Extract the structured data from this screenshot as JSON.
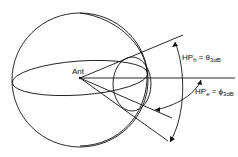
{
  "diagram": {
    "type": "antenna-beam-geometry",
    "labels": {
      "origin": "Ant",
      "hp_h_main": "HP",
      "hp_h_sub": "h",
      "hp_h_eq": " = θ",
      "hp_h_rhs_sub": "3dB",
      "hp_e_main": "HP",
      "hp_e_sub": "e",
      "hp_e_eq": " = ϕ",
      "hp_e_rhs_sub": "3dB"
    },
    "colors": {
      "stroke": "#111111",
      "background": "#ffffff"
    }
  }
}
